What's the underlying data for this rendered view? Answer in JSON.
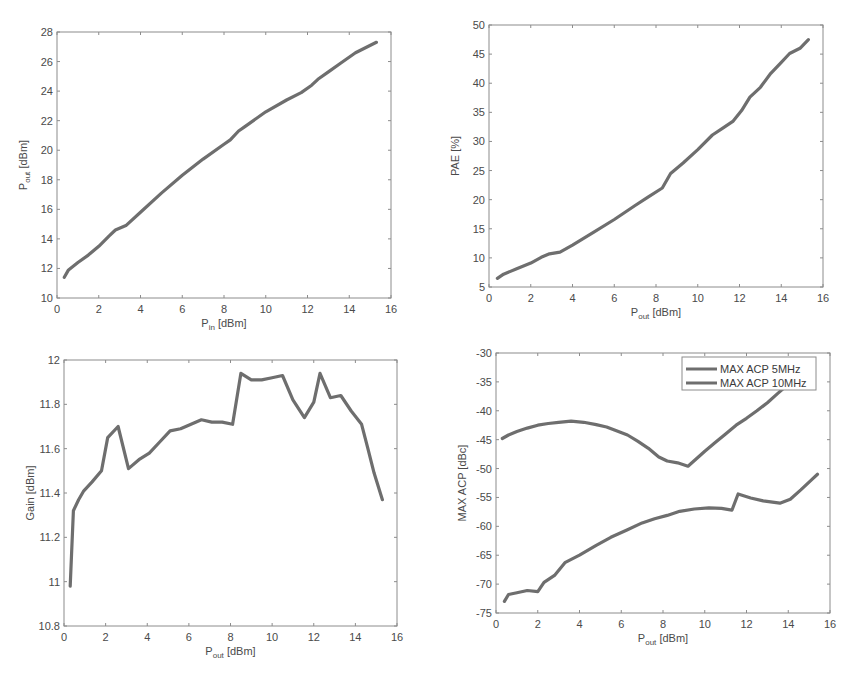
{
  "colors": {
    "line": "#6e6e6e",
    "axis": "#8c8c8c",
    "text": "#4a4a4a",
    "background": "#ffffff"
  },
  "chart_data": [
    {
      "id": "pout_vs_pin",
      "type": "line",
      "title": "",
      "xlabel_main": "P",
      "xlabel_sub": "in",
      "xlabel_unit": " [dBm]",
      "ylabel_main": "P",
      "ylabel_sub": "out",
      "ylabel_unit": " [dBm]",
      "xlim": [
        0,
        16
      ],
      "ylim": [
        10,
        28
      ],
      "xticks": [
        0,
        2,
        4,
        6,
        8,
        10,
        12,
        14,
        16
      ],
      "yticks": [
        10,
        12,
        14,
        16,
        18,
        20,
        22,
        24,
        26,
        28
      ],
      "grid": false,
      "frame": {
        "x0": 57,
        "x1": 391,
        "y0": 298,
        "y1": 32
      },
      "series": [
        {
          "name": "Pout",
          "x": [
            0.35,
            0.55,
            1.0,
            1.5,
            2.0,
            2.5,
            2.8,
            3.3,
            4.0,
            5.0,
            6.0,
            7.0,
            8.0,
            8.3,
            8.7,
            9.0,
            10.0,
            11.0,
            11.7,
            12.2,
            12.5,
            13.0,
            13.6,
            14.3,
            15.3
          ],
          "y": [
            11.4,
            11.9,
            12.4,
            12.9,
            13.5,
            14.2,
            14.6,
            14.9,
            15.8,
            17.1,
            18.3,
            19.4,
            20.4,
            20.7,
            21.3,
            21.6,
            22.6,
            23.4,
            23.9,
            24.4,
            24.8,
            25.3,
            25.9,
            26.6,
            27.3
          ]
        }
      ]
    },
    {
      "id": "pae_vs_pout",
      "type": "line",
      "title": "",
      "xlabel_main": "P",
      "xlabel_sub": "out",
      "xlabel_unit": " [dBm]",
      "ylabel": "PAE [%]",
      "xlim": [
        0,
        16
      ],
      "ylim": [
        5,
        50
      ],
      "xticks": [
        0,
        2,
        4,
        6,
        8,
        10,
        12,
        14,
        16
      ],
      "yticks": [
        5,
        10,
        15,
        20,
        25,
        30,
        35,
        40,
        45,
        50
      ],
      "grid": false,
      "frame": {
        "x0": 489,
        "x1": 823,
        "y0": 287,
        "y1": 25
      },
      "series": [
        {
          "name": "PAE",
          "x": [
            0.4,
            0.7,
            1.3,
            2.0,
            2.5,
            2.9,
            3.4,
            4.0,
            5.0,
            6.0,
            7.0,
            7.6,
            8.3,
            8.7,
            9.3,
            10.0,
            10.7,
            11.2,
            11.7,
            12.1,
            12.5,
            13.0,
            13.5,
            14.0,
            14.4,
            14.9,
            15.3
          ],
          "y": [
            6.5,
            7.2,
            8.1,
            9.1,
            10.1,
            10.7,
            11.0,
            12.2,
            14.4,
            16.6,
            19.0,
            20.4,
            22.0,
            24.5,
            26.3,
            28.6,
            31.1,
            32.3,
            33.5,
            35.3,
            37.6,
            39.3,
            41.7,
            43.6,
            45.1,
            46.0,
            47.5
          ]
        }
      ]
    },
    {
      "id": "gain_vs_pout",
      "type": "line",
      "title": "",
      "xlabel_main": "P",
      "xlabel_sub": "out",
      "xlabel_unit": " [dBm]",
      "ylabel": "Gain [dBm]",
      "xlim": [
        0,
        16
      ],
      "ylim": [
        10.8,
        12
      ],
      "xticks": [
        0,
        2,
        4,
        6,
        8,
        10,
        12,
        14,
        16
      ],
      "yticks": [
        10.8,
        11,
        11.2,
        11.4,
        11.6,
        11.8,
        12
      ],
      "ytick_labels": [
        "10.8",
        "11",
        "11.2",
        "11.4",
        "11.6",
        "11.8",
        "12"
      ],
      "grid": false,
      "frame": {
        "x0": 64,
        "x1": 397,
        "y0": 626,
        "y1": 360
      },
      "series": [
        {
          "name": "Gain",
          "x": [
            0.3,
            0.45,
            0.7,
            0.95,
            1.35,
            1.8,
            2.1,
            2.6,
            3.1,
            3.6,
            4.1,
            4.6,
            5.1,
            5.6,
            6.1,
            6.6,
            7.1,
            7.6,
            8.1,
            8.5,
            9.0,
            9.5,
            10.0,
            10.5,
            11.0,
            11.55,
            12.0,
            12.3,
            12.8,
            13.3,
            13.8,
            14.3,
            14.6,
            14.9,
            15.3
          ],
          "y": [
            10.98,
            11.32,
            11.37,
            11.41,
            11.45,
            11.5,
            11.65,
            11.7,
            11.51,
            11.55,
            11.58,
            11.63,
            11.68,
            11.69,
            11.71,
            11.73,
            11.72,
            11.72,
            11.71,
            11.94,
            11.91,
            11.91,
            11.92,
            11.93,
            11.82,
            11.74,
            11.81,
            11.94,
            11.83,
            11.84,
            11.77,
            11.71,
            11.6,
            11.49,
            11.37
          ]
        }
      ]
    },
    {
      "id": "acp_vs_pout",
      "type": "line",
      "title": "",
      "xlabel_main": "P",
      "xlabel_sub": "out",
      "xlabel_unit": " [dBm]",
      "ylabel": "MAX ACP [dBc]",
      "xlim": [
        0,
        16
      ],
      "ylim": [
        -75,
        -30
      ],
      "xticks": [
        0,
        2,
        4,
        6,
        8,
        10,
        12,
        14,
        16
      ],
      "yticks": [
        -75,
        -70,
        -65,
        -60,
        -55,
        -50,
        -45,
        -40,
        -35,
        -30
      ],
      "grid": false,
      "legend_position": "northeast",
      "frame": {
        "x0": 496,
        "x1": 830,
        "y0": 613,
        "y1": 353
      },
      "series": [
        {
          "name": "MAX ACP 5MHz",
          "x": [
            0.3,
            0.6,
            1.0,
            1.5,
            2.0,
            2.5,
            3.0,
            3.6,
            4.2,
            4.8,
            5.3,
            5.8,
            6.3,
            6.8,
            7.3,
            7.8,
            8.2,
            8.7,
            9.2,
            9.6,
            10.0,
            10.5,
            11.0,
            11.5,
            12.0,
            12.5,
            13.0,
            13.5,
            14.0,
            14.5,
            15.2
          ],
          "y": [
            -44.8,
            -44.2,
            -43.6,
            -43.0,
            -42.5,
            -42.2,
            -42.0,
            -41.8,
            -42.0,
            -42.4,
            -42.8,
            -43.5,
            -44.2,
            -45.3,
            -46.5,
            -48.0,
            -48.7,
            -49.0,
            -49.6,
            -48.3,
            -47.0,
            -45.5,
            -44.0,
            -42.5,
            -41.3,
            -40.0,
            -38.6,
            -37.0,
            -35.4,
            -33.7,
            -31.5
          ]
        },
        {
          "name": "MAX ACP 10MHz",
          "x": [
            0.4,
            0.6,
            1.0,
            1.5,
            2.0,
            2.3,
            2.8,
            3.3,
            4.0,
            4.8,
            5.5,
            6.3,
            7.0,
            7.6,
            8.2,
            8.8,
            9.5,
            10.2,
            10.8,
            11.3,
            11.6,
            12.2,
            12.8,
            13.6,
            14.1,
            14.6,
            15.1,
            15.4
          ],
          "y": [
            -73.0,
            -71.8,
            -71.5,
            -71.1,
            -71.3,
            -69.7,
            -68.5,
            -66.3,
            -65.0,
            -63.3,
            -61.9,
            -60.6,
            -59.4,
            -58.7,
            -58.1,
            -57.4,
            -57.0,
            -56.8,
            -56.9,
            -57.2,
            -54.4,
            -55.1,
            -55.6,
            -56.0,
            -55.3,
            -53.7,
            -52.0,
            -51.0
          ]
        }
      ]
    }
  ]
}
